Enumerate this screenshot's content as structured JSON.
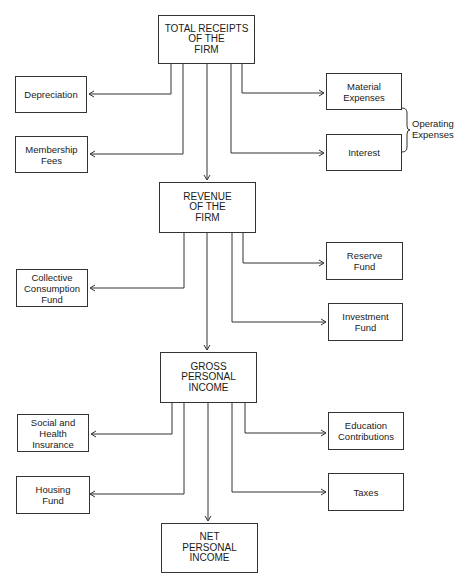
{
  "diagram": {
    "nodes": {
      "total_receipts": "TOTAL RECEIPTS\nOF THE\nFIRM",
      "depreciation": "Depreciation",
      "membership_fees": "Membership\nFees",
      "material_expenses": "Material\nExpenses",
      "interest": "Interest",
      "revenue": "REVENUE\nOF THE\nFIRM",
      "collective_consumption_fund": "Collective\nConsumption\nFund",
      "reserve_fund": "Reserve\nFund",
      "investment_fund": "Investment\nFund",
      "gross_personal_income": "GROSS\nPERSONAL\nINCOME",
      "social_health_insurance": "Social and\nHealth\nInsurance",
      "housing_fund": "Housing\nFund",
      "education_contributions": "Education\nContributions",
      "taxes": "Taxes",
      "net_personal_income": "NET\nPERSONAL\nINCOME"
    },
    "group_label": "Operating\nExpenses",
    "edges": [
      [
        "total_receipts",
        "depreciation"
      ],
      [
        "total_receipts",
        "membership_fees"
      ],
      [
        "total_receipts",
        "material_expenses"
      ],
      [
        "total_receipts",
        "interest"
      ],
      [
        "total_receipts",
        "revenue"
      ],
      [
        "revenue",
        "collective_consumption_fund"
      ],
      [
        "revenue",
        "reserve_fund"
      ],
      [
        "revenue",
        "investment_fund"
      ],
      [
        "revenue",
        "gross_personal_income"
      ],
      [
        "gross_personal_income",
        "social_health_insurance"
      ],
      [
        "gross_personal_income",
        "housing_fund"
      ],
      [
        "gross_personal_income",
        "education_contributions"
      ],
      [
        "gross_personal_income",
        "taxes"
      ],
      [
        "gross_personal_income",
        "net_personal_income"
      ]
    ]
  }
}
